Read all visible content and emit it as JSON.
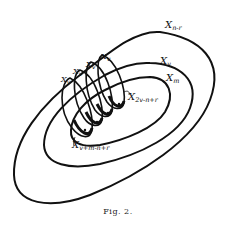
{
  "figure": {
    "caption": "Fig. 2.",
    "sets": [
      {
        "id": "outer",
        "label": "X",
        "sub": "n-r"
      },
      {
        "id": "middle",
        "label": "X",
        "sub": "v"
      },
      {
        "id": "inner",
        "label": "X",
        "sub": "m"
      }
    ],
    "loops": [
      {
        "label": "X",
        "sub": "v"
      },
      {
        "label": "X",
        "sub": "v"
      },
      {
        "label": "X",
        "sub": "v"
      },
      {
        "label": "X",
        "sub": "v"
      }
    ],
    "annotations": [
      {
        "label": "X",
        "sub": "2v-n+r"
      },
      {
        "label": "X",
        "sub": "v+m-n+r"
      }
    ],
    "colors": {
      "stroke": "#111111",
      "background": "#ffffff"
    }
  }
}
